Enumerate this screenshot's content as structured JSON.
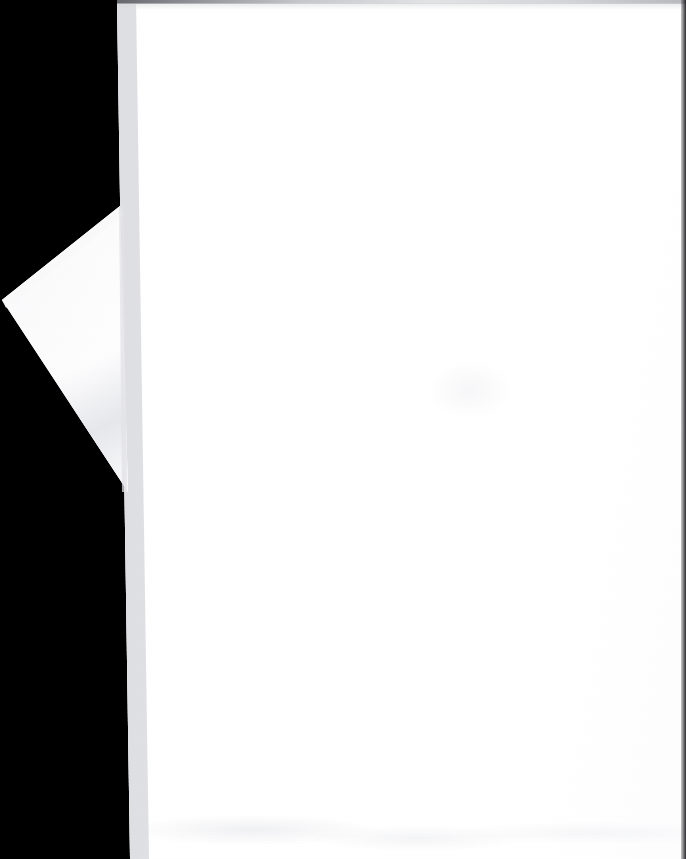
{
  "document": {
    "title": "",
    "page_content_text": "",
    "description": "Scanned blank page with folded lower-left corner on black scanner background",
    "visible_text_present": false,
    "orientation": "portrait",
    "dimensions": {
      "width_px": 686,
      "height_px": 859
    }
  },
  "colors": {
    "background": "#000000",
    "paper": "#ffffff",
    "paper_shade": "#f6f6f8",
    "crease_shadow": "#e2e3e7",
    "top_edge_line": "#606268",
    "right_edge_strip": "#1a1a1e"
  },
  "regions": {
    "scanner_bed": {
      "name": "black scanner background",
      "color": "#000000"
    },
    "page_sheet": {
      "name": "main paper sheet",
      "left_edge_top_x": 117,
      "left_edge_bottom_x": 130,
      "bleeds_off": "right, top, bottom"
    },
    "corner_flap": {
      "name": "folded corner triangle",
      "apex": [
        2,
        300
      ],
      "top_vertex": [
        120,
        206
      ],
      "bottom_vertex": [
        128,
        492
      ]
    },
    "top_edge_shadow": {
      "name": "grey shadow line along top edge",
      "y": 0,
      "height_px": 4
    },
    "right_edge_strip": {
      "name": "dark strip at right frame edge",
      "width_px": 5
    }
  }
}
